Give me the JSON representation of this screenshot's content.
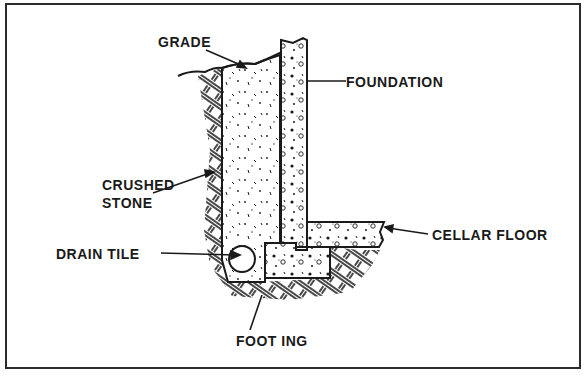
{
  "diagram": {
    "colors": {
      "ink": "#1a1a1a",
      "paper": "#ffffff",
      "frame": "#2b2b2b"
    },
    "labels": {
      "grade": "GRADE",
      "foundation": "FOUNDATION",
      "crushed_stone_line1": "CRUSHED",
      "crushed_stone_line2": "STONE",
      "drain_tile": "DRAIN TILE",
      "cellar_floor": "CELLAR FLOOR",
      "footing": "FOOT ING"
    }
  }
}
